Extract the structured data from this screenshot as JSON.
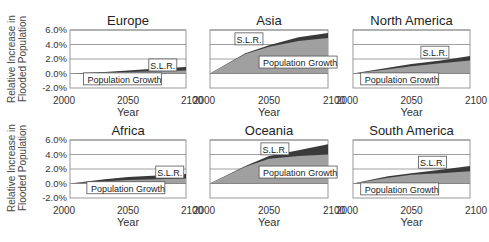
{
  "figure": {
    "ylabel_line1": "Relative Increase in",
    "ylabel_line2": "Flooded Population",
    "xlabel": "Year",
    "yticks": [
      "6.0%",
      "4.0%",
      "2.0%",
      "0.0%",
      "-2.0%"
    ],
    "xticks": [
      "2000",
      "2050",
      "2100"
    ],
    "slr_label": "S.L.R.",
    "pop_label": "Population Growth"
  },
  "colors": {
    "population_fill": "#a0a0a0",
    "slr_fill": "#3a3a3a",
    "gridline": "#888888",
    "frame": "#999999"
  },
  "chart_data": [
    {
      "type": "area",
      "title": "Europe",
      "x": [
        2000,
        2030,
        2050,
        2075,
        2100
      ],
      "series": [
        {
          "name": "Population Growth",
          "values": [
            0.0,
            0.1,
            0.2,
            0.3,
            0.4
          ]
        },
        {
          "name": "S.L.R.",
          "values": [
            0.0,
            0.2,
            0.4,
            0.7,
            0.9
          ]
        }
      ],
      "xlabel": "Year",
      "ylabel": "Relative Increase in Flooded Population",
      "ylim": [
        -2.0,
        6.0
      ],
      "grid": true
    },
    {
      "type": "area",
      "title": "Asia",
      "x": [
        2000,
        2030,
        2050,
        2075,
        2100
      ],
      "series": [
        {
          "name": "Population Growth",
          "values": [
            0.0,
            2.7,
            3.7,
            4.5,
            4.9
          ]
        },
        {
          "name": "S.L.R.",
          "values": [
            0.0,
            2.8,
            3.9,
            5.0,
            5.6
          ]
        }
      ],
      "xlabel": "Year",
      "ylabel": "Relative Increase in Flooded Population",
      "ylim": [
        -2.0,
        6.0
      ],
      "grid": true
    },
    {
      "type": "area",
      "title": "North America",
      "x": [
        2000,
        2030,
        2050,
        2075,
        2100
      ],
      "series": [
        {
          "name": "Population Growth",
          "values": [
            0.0,
            0.6,
            1.0,
            1.4,
            1.8
          ]
        },
        {
          "name": "S.L.R.",
          "values": [
            0.0,
            0.8,
            1.3,
            1.8,
            2.4
          ]
        }
      ],
      "xlabel": "Year",
      "ylabel": "Relative Increase in Flooded Population",
      "ylim": [
        -2.0,
        6.0
      ],
      "grid": true
    },
    {
      "type": "area",
      "title": "Africa",
      "x": [
        2000,
        2030,
        2050,
        2075,
        2100
      ],
      "series": [
        {
          "name": "Population Growth",
          "values": [
            0.0,
            0.3,
            0.5,
            0.6,
            0.7
          ]
        },
        {
          "name": "S.L.R.",
          "values": [
            0.0,
            0.6,
            0.9,
            1.1,
            1.3
          ]
        }
      ],
      "xlabel": "Year",
      "ylabel": "Relative Increase in Flooded Population",
      "ylim": [
        -2.0,
        6.0
      ],
      "grid": true
    },
    {
      "type": "area",
      "title": "Oceania",
      "x": [
        2000,
        2030,
        2050,
        2075,
        2100
      ],
      "series": [
        {
          "name": "Population Growth",
          "values": [
            0.0,
            2.3,
            3.4,
            3.8,
            4.0
          ]
        },
        {
          "name": "S.L.R.",
          "values": [
            0.0,
            2.4,
            3.8,
            4.6,
            5.4
          ]
        }
      ],
      "xlabel": "Year",
      "ylabel": "Relative Increase in Flooded Population",
      "ylim": [
        -2.0,
        6.0
      ],
      "grid": true
    },
    {
      "type": "area",
      "title": "South America",
      "x": [
        2000,
        2030,
        2050,
        2075,
        2100
      ],
      "series": [
        {
          "name": "Population Growth",
          "values": [
            0.0,
            0.8,
            1.2,
            1.4,
            1.7
          ]
        },
        {
          "name": "S.L.R.",
          "values": [
            0.0,
            1.0,
            1.4,
            1.9,
            2.4
          ]
        }
      ],
      "xlabel": "Year",
      "ylabel": "Relative Increase in Flooded Population",
      "ylim": [
        -2.0,
        6.0
      ],
      "grid": true
    }
  ],
  "layout": [
    {
      "left": 70,
      "top": 30,
      "w": 116,
      "h": 58,
      "slr": [
        0.8,
        0.62
      ],
      "pop": [
        0.15,
        0.86
      ]
    },
    {
      "left": 210,
      "top": 30,
      "w": 118,
      "h": 58,
      "slr": [
        0.33,
        0.17
      ],
      "pop": [
        0.45,
        0.57
      ]
    },
    {
      "left": 353,
      "top": 30,
      "w": 117,
      "h": 58,
      "slr": [
        0.7,
        0.4
      ],
      "pop": [
        0.1,
        0.86
      ]
    },
    {
      "left": 70,
      "top": 140,
      "w": 116,
      "h": 58,
      "slr": [
        0.86,
        0.57
      ],
      "pop": [
        0.18,
        0.84
      ]
    },
    {
      "left": 210,
      "top": 140,
      "w": 118,
      "h": 58,
      "slr": [
        0.55,
        0.17
      ],
      "pop": [
        0.45,
        0.57
      ]
    },
    {
      "left": 353,
      "top": 140,
      "w": 117,
      "h": 58,
      "slr": [
        0.68,
        0.4
      ],
      "pop": [
        0.1,
        0.86
      ]
    }
  ]
}
